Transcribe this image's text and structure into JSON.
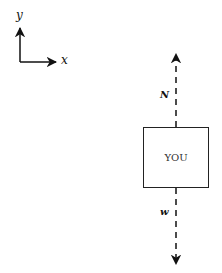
{
  "axes": {
    "y_label": "y",
    "x_label": "x"
  },
  "directions": {
    "up_label": "N",
    "down_label": "w"
  },
  "box": {
    "label": "YOU"
  },
  "colors": {
    "stroke": "#111111",
    "background": "#ffffff"
  }
}
